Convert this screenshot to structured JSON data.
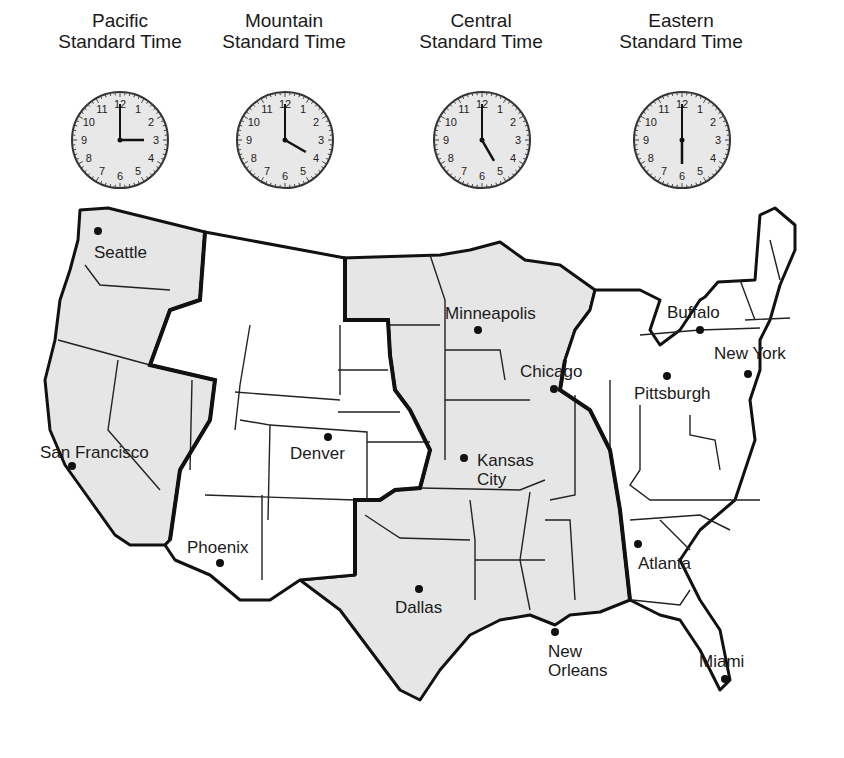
{
  "zones": [
    {
      "id": "pacific",
      "line1": "Pacific",
      "line2": "Standard Time",
      "time": "3:00",
      "hour": 3,
      "minute": 0,
      "shaded": true
    },
    {
      "id": "mountain",
      "line1": "Mountain",
      "line2": "Standard Time",
      "time": "4:00",
      "hour": 4,
      "minute": 0,
      "shaded": false
    },
    {
      "id": "central",
      "line1": "Central",
      "line2": "Standard Time",
      "time": "5:00",
      "hour": 5,
      "minute": 0,
      "shaded": true
    },
    {
      "id": "eastern",
      "line1": "Eastern",
      "line2": "Standard Time",
      "time": "6:00",
      "hour": 6,
      "minute": 0,
      "shaded": false
    }
  ],
  "clock_numerals": [
    "12",
    "1",
    "2",
    "3",
    "4",
    "5",
    "6",
    "7",
    "8",
    "9",
    "10",
    "11"
  ],
  "cities": [
    {
      "name": "Seattle",
      "zone": "pacific"
    },
    {
      "name": "San Francisco",
      "zone": "pacific"
    },
    {
      "name": "Phoenix",
      "zone": "mountain"
    },
    {
      "name": "Denver",
      "zone": "mountain"
    },
    {
      "name": "Minneapolis",
      "zone": "central"
    },
    {
      "name": "Kansas",
      "name_line2": "City",
      "zone": "central"
    },
    {
      "name": "Chicago",
      "zone": "central"
    },
    {
      "name": "Dallas",
      "zone": "central"
    },
    {
      "name": "New",
      "name_line2": "Orleans",
      "zone": "central"
    },
    {
      "name": "Buffalo",
      "zone": "eastern"
    },
    {
      "name": "New York",
      "zone": "eastern"
    },
    {
      "name": "Pittsburgh",
      "zone": "eastern"
    },
    {
      "name": "Atlanta",
      "zone": "eastern"
    },
    {
      "name": "Miami",
      "zone": "eastern"
    }
  ],
  "colors": {
    "shaded_zone": "#e6e6e6",
    "unshaded_zone": "#ffffff",
    "border": "#111111",
    "clock_face": "#e8e8e8"
  }
}
